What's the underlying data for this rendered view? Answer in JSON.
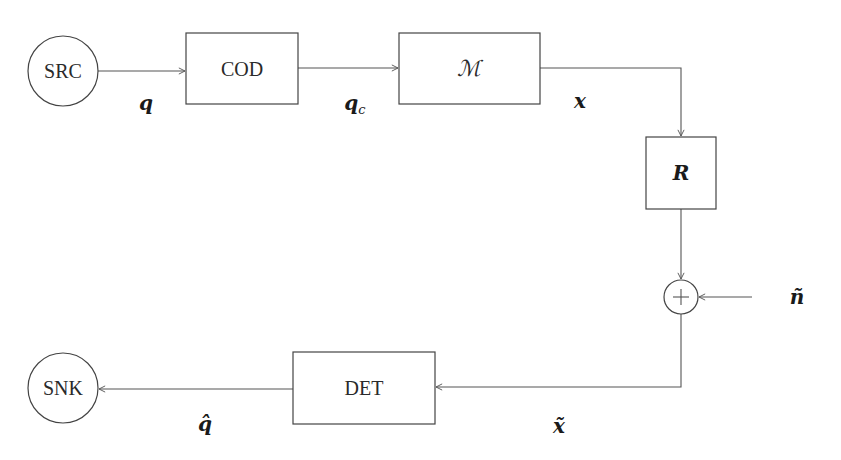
{
  "diagram": {
    "type": "block-diagram",
    "nodes": {
      "src": {
        "label": "SRC",
        "shape": "circle"
      },
      "cod": {
        "label": "COD",
        "shape": "rect"
      },
      "mod": {
        "label": "ℳ",
        "shape": "rect"
      },
      "r": {
        "label": "R",
        "shape": "rect"
      },
      "sum": {
        "label": "+",
        "shape": "circle"
      },
      "det": {
        "label": "DET",
        "shape": "rect"
      },
      "snk": {
        "label": "SNK",
        "shape": "circle"
      }
    },
    "signals": {
      "q": {
        "base": "q",
        "sub": ""
      },
      "qc": {
        "base": "q",
        "sub": "c"
      },
      "x": {
        "base": "x",
        "sub": ""
      },
      "n_tilde": {
        "base": "ñ",
        "sub": ""
      },
      "x_tilde": {
        "base": "x̃",
        "sub": ""
      },
      "q_hat": {
        "base": "q̂",
        "sub": ""
      }
    },
    "edges": [
      {
        "from": "SRC",
        "to": "COD",
        "label": "q"
      },
      {
        "from": "COD",
        "to": "ℳ",
        "label": "q_c"
      },
      {
        "from": "ℳ",
        "to": "R",
        "label": "x"
      },
      {
        "from": "R",
        "to": "+",
        "label": ""
      },
      {
        "from": "ñ",
        "to": "+",
        "label": "ñ"
      },
      {
        "from": "+",
        "to": "DET",
        "label": "x̃"
      },
      {
        "from": "DET",
        "to": "SNK",
        "label": "q̂"
      }
    ],
    "colors": {
      "stroke": "#444444",
      "text": "#2a2a2a",
      "background": "#ffffff"
    }
  }
}
